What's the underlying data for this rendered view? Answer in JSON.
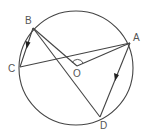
{
  "diagram": {
    "type": "circle-geometry",
    "circle": {
      "cx": 76,
      "cy": 68,
      "r": 57
    },
    "points": {
      "A": {
        "label": "A",
        "x": 130,
        "y": 43
      },
      "B": {
        "label": "B",
        "x": 33,
        "y": 28
      },
      "C": {
        "label": "C",
        "x": 20,
        "y": 67
      },
      "D": {
        "label": "D",
        "x": 100,
        "y": 117
      },
      "O": {
        "label": "O",
        "x": 77,
        "y": 66
      }
    },
    "segments": [
      "B-C",
      "B-O",
      "B-D",
      "C-A",
      "A-O",
      "A-D"
    ],
    "arrows": [
      "on BC toward C",
      "on AD toward D"
    ],
    "angle_mark": "angle BOA at O",
    "colors": {
      "stroke": "#444444",
      "label": "#555555"
    }
  }
}
